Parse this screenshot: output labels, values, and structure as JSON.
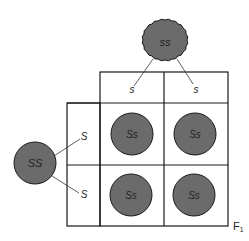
{
  "parents": {
    "top": {
      "genotype": "ss",
      "shape": "wrinkled",
      "gametes": [
        "s",
        "s"
      ]
    },
    "left": {
      "genotype": "SS",
      "shape": "round",
      "gametes": [
        "S",
        "S"
      ]
    }
  },
  "offspring": [
    [
      "Ss",
      "Ss"
    ],
    [
      "Ss",
      "Ss"
    ]
  ],
  "generation_label": "F",
  "generation_sub": "1",
  "colors": {
    "seed_fill": "#6b6b6b",
    "line": "#1a1a1a"
  }
}
